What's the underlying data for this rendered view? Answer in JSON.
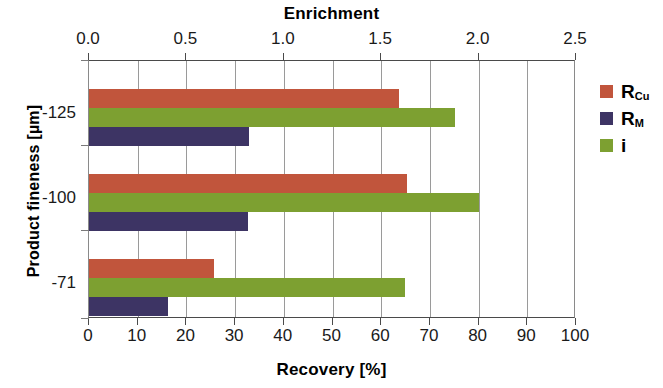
{
  "chart_data": {
    "type": "bar",
    "orientation": "horizontal",
    "title": "",
    "top_axis_title": "Enrichment",
    "bottom_axis_title": "Recovery [%]",
    "ylabel": "Product  fineness  [µm]",
    "categories": [
      "-125",
      "-100",
      "-71"
    ],
    "series": [
      {
        "name": "R_Cu",
        "label": "R",
        "sublabel": "Cu",
        "color": "#c1553c",
        "axis": "bottom",
        "unit": "%",
        "values": [
          63.7,
          65.3,
          25.7
        ]
      },
      {
        "name": "R_M",
        "label": "R",
        "sublabel": "M",
        "color": "#3d3464",
        "axis": "bottom",
        "unit": "%",
        "values": [
          32.8,
          32.7,
          16.2
        ]
      },
      {
        "name": "i",
        "label": "i",
        "sublabel": "",
        "color": "#7da031",
        "axis": "top",
        "unit": "",
        "values": [
          1.88,
          2.0,
          1.62
        ]
      }
    ],
    "bottom_axis": {
      "label": "Recovery [%]",
      "ticks": [
        "0",
        "10",
        "20",
        "30",
        "40",
        "50",
        "60",
        "70",
        "80",
        "90",
        "100"
      ],
      "min": 0,
      "max": 100
    },
    "top_axis": {
      "label": "Enrichment",
      "ticks": [
        "0.0",
        "0.5",
        "1.0",
        "1.5",
        "2.0",
        "2.5"
      ],
      "min": 0,
      "max": 2.5
    },
    "grid": true,
    "gridline_values": [
      10,
      20,
      30,
      40,
      50,
      60,
      70,
      80,
      90
    ],
    "legend": {
      "position": "right",
      "entries": [
        {
          "label": "R",
          "sublabel": "Cu",
          "color": "#c1553c"
        },
        {
          "label": "R",
          "sublabel": "M",
          "color": "#3d3464"
        },
        {
          "label": "i",
          "sublabel": "",
          "color": "#7da031"
        }
      ]
    },
    "colors": {
      "rcu": "#c1553c",
      "rm": "#3d3464",
      "i": "#7da031",
      "axis": "#4a4a4a",
      "grid": "#9a9a9a",
      "background": "#ffffff"
    }
  }
}
